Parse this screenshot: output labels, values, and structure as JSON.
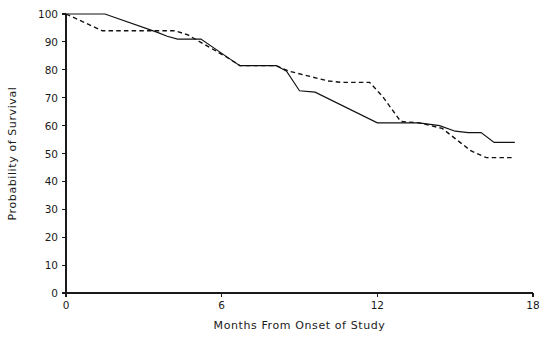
{
  "chart_data": {
    "type": "line",
    "title": "",
    "xlabel": "Months From Onset of Study",
    "ylabel": "Probability of Survival",
    "xlim": [
      0,
      18
    ],
    "ylim": [
      0,
      100
    ],
    "xticks": [
      0,
      6,
      12,
      18
    ],
    "xtick_labels": [
      "0",
      "6",
      "12",
      "18"
    ],
    "yticks": [
      0,
      10,
      20,
      30,
      40,
      50,
      60,
      70,
      80,
      90,
      100
    ],
    "ytick_labels": [
      "0",
      "10",
      "20",
      "30",
      "40",
      "50",
      "60",
      "70",
      "80",
      "90",
      "100"
    ],
    "grid": false,
    "legend": null,
    "legend_position": "none",
    "series": [
      {
        "name": "solid-curve",
        "style": "solid",
        "color": "#111111",
        "points": [
          [
            0.0,
            100.0
          ],
          [
            1.5,
            100.0
          ],
          [
            3.5,
            93.5
          ],
          [
            3.9,
            92.0
          ],
          [
            4.3,
            91.0
          ],
          [
            5.2,
            91.0
          ],
          [
            6.3,
            84.0
          ],
          [
            6.7,
            81.5
          ],
          [
            8.1,
            81.5
          ],
          [
            8.5,
            79.5
          ],
          [
            9.0,
            72.5
          ],
          [
            9.6,
            72.0
          ],
          [
            12.0,
            61.0
          ],
          [
            13.6,
            61.0
          ],
          [
            14.4,
            60.0
          ],
          [
            15.0,
            58.0
          ],
          [
            15.5,
            57.5
          ],
          [
            16.0,
            57.5
          ],
          [
            16.5,
            54.0
          ],
          [
            17.3,
            54.0
          ]
        ]
      },
      {
        "name": "dashed-curve",
        "style": "dashed",
        "color": "#111111",
        "points": [
          [
            0.0,
            100.0
          ],
          [
            1.4,
            94.0
          ],
          [
            4.2,
            94.0
          ],
          [
            4.7,
            92.5
          ],
          [
            6.2,
            84.5
          ],
          [
            6.7,
            81.5
          ],
          [
            8.1,
            81.5
          ],
          [
            8.6,
            79.5
          ],
          [
            10.1,
            76.0
          ],
          [
            10.6,
            75.5
          ],
          [
            11.7,
            75.5
          ],
          [
            12.2,
            70.5
          ],
          [
            12.9,
            61.5
          ],
          [
            13.6,
            61.0
          ],
          [
            14.5,
            59.0
          ],
          [
            15.6,
            51.0
          ],
          [
            16.2,
            48.5
          ],
          [
            17.3,
            48.5
          ]
        ]
      }
    ]
  }
}
